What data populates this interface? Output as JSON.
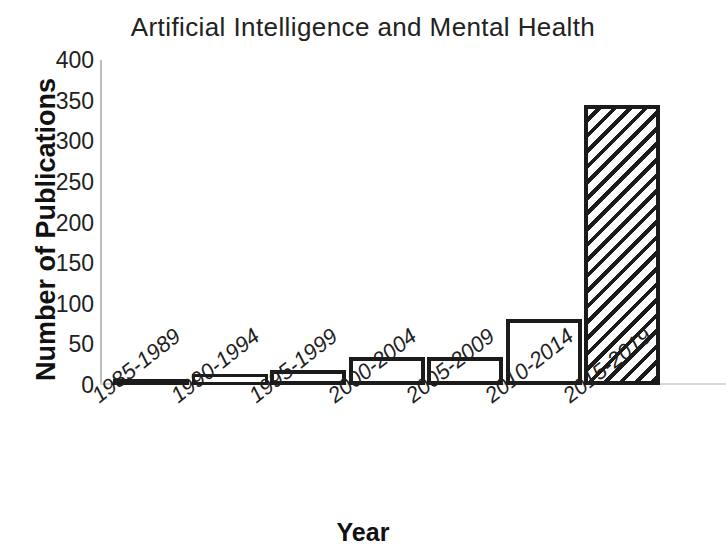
{
  "chart_data": {
    "type": "bar",
    "title": "Artificial Intelligence and Mental Health",
    "xlabel": "Year",
    "ylabel": "Number of Publications",
    "categories": [
      "1985-1989",
      "1990-1994",
      "1995-1999",
      "2000-2004",
      "2005-2009",
      "2010-2014",
      "2015-2019"
    ],
    "values": [
      3,
      14,
      18,
      34,
      35,
      81,
      345
    ],
    "ylim": [
      0,
      400
    ],
    "yticks": [
      0,
      50,
      100,
      150,
      200,
      250,
      300,
      350,
      400
    ],
    "ytick_labels": [
      "0",
      "50",
      "100",
      "150",
      "200",
      "250",
      "300",
      "350",
      "400"
    ],
    "grid": false,
    "legend": "none",
    "bar_styles": [
      "outline",
      "outline",
      "outline",
      "outline",
      "outline",
      "outline",
      "hatched-diagonal"
    ],
    "bar_edge_color": "#1b1b1b",
    "bar_fill_color": "#ffffff",
    "note": "final bar is hatched and extends past the right edge of the figure"
  },
  "axes": {
    "y_title": "Number of Publications",
    "x_title": "Year"
  }
}
